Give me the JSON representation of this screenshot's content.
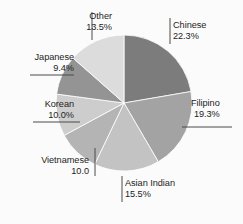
{
  "chart_data": {
    "type": "pie",
    "title": "",
    "subtitle": "",
    "xlabel": "",
    "ylabel": "",
    "legend_position": "none",
    "grid": false,
    "start_angle_deg": 0,
    "direction": "clockwise",
    "categories": [
      "Chinese",
      "Filipino",
      "Asian Indian",
      "Vietnamese",
      "Korean",
      "Japanese",
      "Other"
    ],
    "values": [
      22.3,
      19.3,
      15.5,
      10.0,
      10.0,
      9.4,
      13.5
    ],
    "value_suffix": "%",
    "slices": [
      {
        "label": "Chinese",
        "value": 22.3,
        "value_text": "22.3%",
        "color": "#7c7c7c",
        "leader": "vertical-left"
      },
      {
        "label": "Filipino",
        "value": 19.3,
        "value_text": "19.3%",
        "color": "#a3a3a3",
        "leader": "underline-left"
      },
      {
        "label": "Asian Indian",
        "value": 15.5,
        "value_text": "15.5%",
        "color": "#c3c3c3",
        "leader": "vertical-left"
      },
      {
        "label": "Vietnamese",
        "value": 10.0,
        "value_text": "10.0",
        "color": "#b4b4b4",
        "leader": "vertical-right"
      },
      {
        "label": "Korean",
        "value": 10.0,
        "value_text": "10.0%",
        "color": "#cdcdcd",
        "leader": "underline-right"
      },
      {
        "label": "Japanese",
        "value": 9.4,
        "value_text": "9.4%",
        "color": "#949494",
        "leader": "underline-right"
      },
      {
        "label": "Other",
        "value": 13.5,
        "value_text": "13.5%",
        "color": "#dcdcdc",
        "leader": "vertical-right"
      }
    ]
  },
  "colors": {
    "background": "#fbfbfb",
    "text": "#1d1d1d",
    "leader_line": "#4a4a4a",
    "slice_outline": "#ffffff"
  }
}
